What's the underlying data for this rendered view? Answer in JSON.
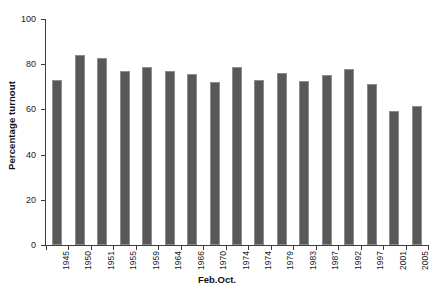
{
  "chart_data": {
    "type": "bar",
    "title": "",
    "xlabel": "Feb.Oct.",
    "ylabel": "Percentage turnout",
    "ylim": [
      0,
      100
    ],
    "yticks": [
      0,
      20,
      40,
      60,
      80,
      100
    ],
    "grid": false,
    "legend": null,
    "bar_color": "#585858",
    "bar_edge_color": "#8d8d8d",
    "axis_color": "#3d3d3d",
    "categories": [
      "1945",
      "1950",
      "1951",
      "1955",
      "1959",
      "1964",
      "1966",
      "1970",
      "1974",
      "1974",
      "1979",
      "1983",
      "1987",
      "1992",
      "1997",
      "2001",
      "2005"
    ],
    "values": [
      72.8,
      84.0,
      82.6,
      77.1,
      78.7,
      77.1,
      75.8,
      72.0,
      78.8,
      72.8,
      76.0,
      72.7,
      75.3,
      77.7,
      71.4,
      59.4,
      61.4
    ],
    "points": [
      {
        "label": "1945",
        "value": 72.8
      },
      {
        "label": "1950",
        "value": 84.0
      },
      {
        "label": "1951",
        "value": 82.6
      },
      {
        "label": "1955",
        "value": 77.1
      },
      {
        "label": "1959",
        "value": 78.7
      },
      {
        "label": "1964",
        "value": 77.1
      },
      {
        "label": "1966",
        "value": 75.8
      },
      {
        "label": "1970",
        "value": 72.0
      },
      {
        "label": "1974",
        "value": 78.8
      },
      {
        "label": "1974",
        "value": 72.8
      },
      {
        "label": "1979",
        "value": 76.0
      },
      {
        "label": "1983",
        "value": 72.7
      },
      {
        "label": "1987",
        "value": 75.3
      },
      {
        "label": "1992",
        "value": 77.7
      },
      {
        "label": "1997",
        "value": 71.4
      },
      {
        "label": "2001",
        "value": 59.4
      },
      {
        "label": "2005",
        "value": 61.4
      }
    ]
  }
}
